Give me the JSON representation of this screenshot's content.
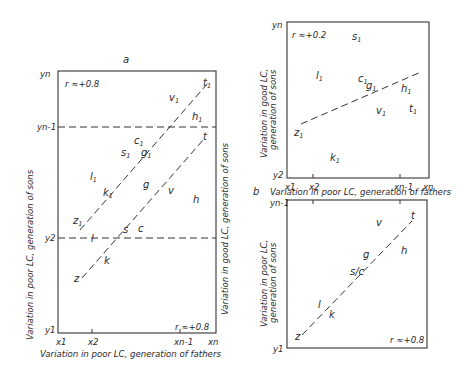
{
  "figure": {
    "panel_a": {
      "label": "a",
      "r_top": "r ≈+0.8",
      "r_bottom": "r ≈+0.8",
      "ylabel_left": "Variation in poor LC, generation of sons",
      "ylabel_right": "Variation in good LC, generation of sons",
      "xlabel": "Variation in poor LC, generation of fathers",
      "y_ticks": [
        "yn",
        "yn-1",
        "y2",
        "y1"
      ],
      "x_ticks": [
        "x1",
        "x2",
        "xn-1",
        "xn"
      ],
      "points_upper": [
        {
          "base": "t",
          "sub": "1"
        },
        {
          "base": "v",
          "sub": "1"
        },
        {
          "base": "h",
          "sub": "1"
        },
        {
          "base": "c",
          "sub": "1"
        },
        {
          "base": "s",
          "sub": "1"
        },
        {
          "base": "g",
          "sub": "1"
        },
        {
          "base": "l",
          "sub": "1"
        },
        {
          "base": "k",
          "sub": "1"
        },
        {
          "base": "z",
          "sub": "1"
        }
      ],
      "points_lower": [
        "t",
        "g",
        "v",
        "h",
        "s",
        "c",
        "l",
        "k",
        "z"
      ]
    },
    "panel_b_top": {
      "label": "b",
      "r": "r ≈+0.2",
      "ylabel_line1": "Variation in good LC,",
      "ylabel_line2": "generation of sons",
      "xlabel": "Variation in poor LC, generation of fathers",
      "y_ticks": [
        "yn",
        "y2"
      ],
      "x_ticks": [
        "x1",
        "x2",
        "xn-1",
        "xn"
      ],
      "points": [
        {
          "base": "s",
          "sub": "1"
        },
        {
          "base": "l",
          "sub": "1"
        },
        {
          "base": "c",
          "sub": "1"
        },
        {
          "base": "g",
          "sub": "1"
        },
        {
          "base": "h",
          "sub": "1"
        },
        {
          "base": "v",
          "sub": "1"
        },
        {
          "base": "t",
          "sub": "1"
        },
        {
          "base": "z",
          "sub": "1"
        },
        {
          "base": "k",
          "sub": "1"
        }
      ]
    },
    "panel_b_bottom": {
      "r": "r ≈+0.8",
      "ylabel_line1": "Variation in poor LC,",
      "ylabel_line2": "generation of sons",
      "y_ticks": [
        "yn-1",
        "y1"
      ],
      "points": [
        "v",
        "t",
        "h",
        "g",
        "s/c",
        "l",
        "k",
        "z"
      ]
    }
  }
}
